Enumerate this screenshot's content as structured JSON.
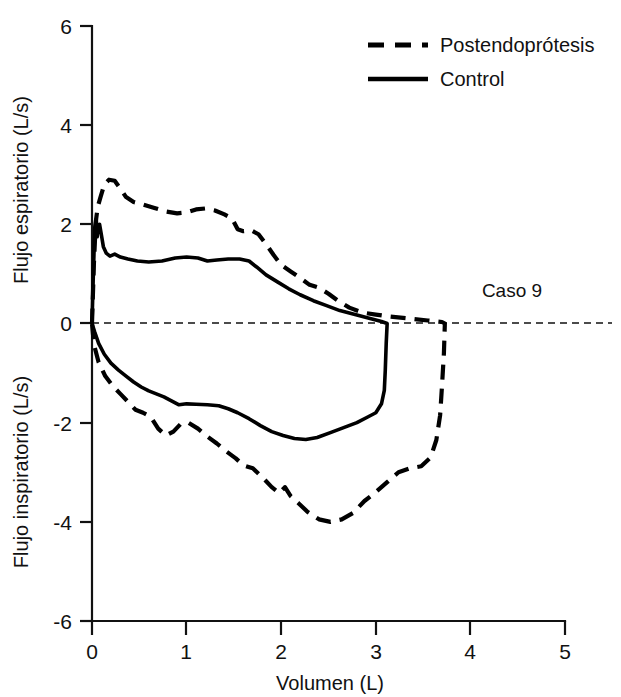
{
  "chart_data": {
    "type": "line",
    "title": "",
    "subtitle": "",
    "xlabel": "Volumen (L)",
    "ylabel_upper": "Flujo espiratorio (L/s)",
    "ylabel_lower": "Flujo inspiratorio (L/s)",
    "xlim": [
      0,
      5
    ],
    "ylim": [
      -6,
      6
    ],
    "xticks": [
      0,
      1,
      2,
      3,
      4,
      5
    ],
    "xtick_labels": [
      "0",
      "1",
      "2",
      "3",
      "4",
      "5"
    ],
    "yticks": [
      6,
      4,
      2,
      0,
      -2,
      -4,
      -6
    ],
    "ytick_labels": [
      "6",
      "4",
      "2",
      "0",
      "-2",
      "-4",
      "-6"
    ],
    "grid": false,
    "zero_reference_line": true,
    "legend_position": "top-right",
    "annotations": [
      {
        "text": "Caso 9",
        "x": 4.35,
        "y": 0.95
      }
    ],
    "series": [
      {
        "name": "Postendoprótesis",
        "style": "dashed",
        "color": "#000000",
        "points_expiratory": [
          [
            0.0,
            0.0
          ],
          [
            0.02,
            1.2
          ],
          [
            0.04,
            2.05
          ],
          [
            0.06,
            2.35
          ],
          [
            0.09,
            2.55
          ],
          [
            0.13,
            2.8
          ],
          [
            0.18,
            2.9
          ],
          [
            0.24,
            2.88
          ],
          [
            0.3,
            2.72
          ],
          [
            0.36,
            2.55
          ],
          [
            0.44,
            2.45
          ],
          [
            0.54,
            2.4
          ],
          [
            0.66,
            2.33
          ],
          [
            0.78,
            2.26
          ],
          [
            0.9,
            2.22
          ],
          [
            1.0,
            2.24
          ],
          [
            1.1,
            2.3
          ],
          [
            1.2,
            2.32
          ],
          [
            1.3,
            2.28
          ],
          [
            1.4,
            2.2
          ],
          [
            1.48,
            2.12
          ],
          [
            1.54,
            1.9
          ],
          [
            1.6,
            1.86
          ],
          [
            1.68,
            1.88
          ],
          [
            1.76,
            1.8
          ],
          [
            1.84,
            1.6
          ],
          [
            1.92,
            1.38
          ],
          [
            2.0,
            1.18
          ],
          [
            2.1,
            1.05
          ],
          [
            2.2,
            0.92
          ],
          [
            2.3,
            0.78
          ],
          [
            2.4,
            0.72
          ],
          [
            2.5,
            0.6
          ],
          [
            2.6,
            0.46
          ],
          [
            2.72,
            0.32
          ],
          [
            2.86,
            0.22
          ],
          [
            3.0,
            0.18
          ],
          [
            3.15,
            0.14
          ],
          [
            3.35,
            0.1
          ],
          [
            3.55,
            0.06
          ],
          [
            3.7,
            0.03
          ],
          [
            3.73,
            0.0
          ]
        ],
        "points_inspiratory": [
          [
            3.73,
            0.0
          ],
          [
            3.72,
            -0.6
          ],
          [
            3.7,
            -1.25
          ],
          [
            3.68,
            -1.85
          ],
          [
            3.64,
            -2.35
          ],
          [
            3.58,
            -2.7
          ],
          [
            3.48,
            -2.88
          ],
          [
            3.36,
            -2.92
          ],
          [
            3.24,
            -3.0
          ],
          [
            3.12,
            -3.2
          ],
          [
            3.0,
            -3.4
          ],
          [
            2.88,
            -3.58
          ],
          [
            2.76,
            -3.82
          ],
          [
            2.64,
            -3.95
          ],
          [
            2.52,
            -4.0
          ],
          [
            2.4,
            -3.95
          ],
          [
            2.28,
            -3.8
          ],
          [
            2.18,
            -3.62
          ],
          [
            2.1,
            -3.48
          ],
          [
            2.04,
            -3.3
          ],
          [
            1.98,
            -3.42
          ],
          [
            1.9,
            -3.3
          ],
          [
            1.8,
            -3.1
          ],
          [
            1.7,
            -2.92
          ],
          [
            1.6,
            -2.86
          ],
          [
            1.52,
            -2.72
          ],
          [
            1.42,
            -2.58
          ],
          [
            1.32,
            -2.42
          ],
          [
            1.22,
            -2.28
          ],
          [
            1.12,
            -2.12
          ],
          [
            1.02,
            -2.0
          ],
          [
            0.94,
            -2.02
          ],
          [
            0.86,
            -2.18
          ],
          [
            0.78,
            -2.26
          ],
          [
            0.7,
            -2.12
          ],
          [
            0.62,
            -1.88
          ],
          [
            0.54,
            -1.8
          ],
          [
            0.46,
            -1.74
          ],
          [
            0.38,
            -1.58
          ],
          [
            0.3,
            -1.42
          ],
          [
            0.22,
            -1.26
          ],
          [
            0.14,
            -1.06
          ],
          [
            0.07,
            -0.78
          ],
          [
            0.02,
            -0.42
          ],
          [
            0.0,
            0.0
          ]
        ]
      },
      {
        "name": "Control",
        "style": "solid",
        "color": "#000000",
        "points_expiratory": [
          [
            0.0,
            0.0
          ],
          [
            0.015,
            1.05
          ],
          [
            0.03,
            1.95
          ],
          [
            0.045,
            2.1
          ],
          [
            0.055,
            1.75
          ],
          [
            0.065,
            1.95
          ],
          [
            0.08,
            2.0
          ],
          [
            0.1,
            1.78
          ],
          [
            0.12,
            1.55
          ],
          [
            0.15,
            1.42
          ],
          [
            0.19,
            1.36
          ],
          [
            0.24,
            1.4
          ],
          [
            0.3,
            1.34
          ],
          [
            0.38,
            1.3
          ],
          [
            0.48,
            1.26
          ],
          [
            0.6,
            1.24
          ],
          [
            0.74,
            1.26
          ],
          [
            0.88,
            1.32
          ],
          [
            1.0,
            1.34
          ],
          [
            1.12,
            1.32
          ],
          [
            1.22,
            1.26
          ],
          [
            1.32,
            1.28
          ],
          [
            1.44,
            1.3
          ],
          [
            1.56,
            1.3
          ],
          [
            1.66,
            1.26
          ],
          [
            1.74,
            1.14
          ],
          [
            1.84,
            0.98
          ],
          [
            1.96,
            0.84
          ],
          [
            2.08,
            0.7
          ],
          [
            2.2,
            0.58
          ],
          [
            2.34,
            0.46
          ],
          [
            2.48,
            0.36
          ],
          [
            2.62,
            0.26
          ],
          [
            2.78,
            0.18
          ],
          [
            2.94,
            0.1
          ],
          [
            3.06,
            0.04
          ],
          [
            3.12,
            0.0
          ]
        ],
        "points_inspiratory": [
          [
            3.12,
            0.0
          ],
          [
            3.11,
            -0.4
          ],
          [
            3.1,
            -0.95
          ],
          [
            3.09,
            -1.35
          ],
          [
            3.06,
            -1.62
          ],
          [
            3.0,
            -1.8
          ],
          [
            2.92,
            -1.88
          ],
          [
            2.8,
            -2.0
          ],
          [
            2.66,
            -2.1
          ],
          [
            2.52,
            -2.2
          ],
          [
            2.38,
            -2.3
          ],
          [
            2.26,
            -2.34
          ],
          [
            2.14,
            -2.32
          ],
          [
            2.02,
            -2.26
          ],
          [
            1.9,
            -2.18
          ],
          [
            1.78,
            -2.06
          ],
          [
            1.66,
            -1.92
          ],
          [
            1.54,
            -1.8
          ],
          [
            1.44,
            -1.72
          ],
          [
            1.34,
            -1.66
          ],
          [
            1.22,
            -1.64
          ],
          [
            1.1,
            -1.63
          ],
          [
            1.0,
            -1.62
          ],
          [
            0.92,
            -1.64
          ],
          [
            0.84,
            -1.56
          ],
          [
            0.76,
            -1.48
          ],
          [
            0.68,
            -1.42
          ],
          [
            0.6,
            -1.36
          ],
          [
            0.52,
            -1.28
          ],
          [
            0.44,
            -1.18
          ],
          [
            0.36,
            -1.06
          ],
          [
            0.28,
            -0.94
          ],
          [
            0.2,
            -0.8
          ],
          [
            0.13,
            -0.62
          ],
          [
            0.07,
            -0.4
          ],
          [
            0.03,
            -0.18
          ],
          [
            0.0,
            0.0
          ]
        ]
      }
    ]
  },
  "legend": {
    "items": [
      {
        "label": "Postendoprótesis",
        "style": "dashed"
      },
      {
        "label": "Control",
        "style": "solid"
      }
    ]
  },
  "axes": {
    "x_title": "Volumen (L)",
    "y_title_upper": "Flujo espiratorio (L/s)",
    "y_title_lower": "Flujo inspiratorio (L/s)",
    "x_tick_labels": [
      "0",
      "1",
      "2",
      "3",
      "4",
      "5"
    ],
    "y_tick_labels": [
      "6",
      "4",
      "2",
      "0",
      "-2",
      "-4",
      "-6"
    ]
  },
  "annotation": {
    "case_label": "Caso 9"
  },
  "colors": {
    "ink": "#000000",
    "background": "#ffffff"
  }
}
